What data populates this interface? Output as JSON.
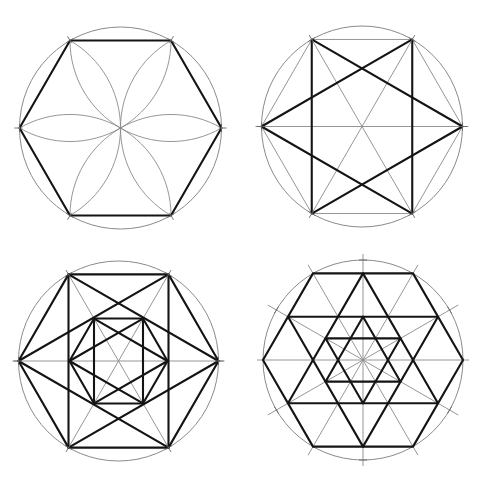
{
  "colors": {
    "background": "#ffffff",
    "bold_line": "#141414",
    "guide_line": "#8a8a8a"
  },
  "panels": [
    {
      "id": "hexagon-with-petals",
      "description": "Regular hexagon inscribed in a circle with six-petal rosette arcs (compass construction)",
      "center": [
        120.5,
        128
      ],
      "radius": 101,
      "elements": [
        "circle",
        "hexagon-bold",
        "petal-arcs",
        "vertex-ticks"
      ]
    },
    {
      "id": "hexagram-in-hexagon",
      "description": "Six-pointed star drawn between hexagon vertices, with rectangle sides and diagonal guides",
      "center": [
        362,
        126.5
      ],
      "radius": 100.5,
      "elements": [
        "circle",
        "hexagon-thin",
        "horizontal-diameter",
        "diagonals",
        "hexagram-bold",
        "vertex-ticks"
      ]
    },
    {
      "id": "nested-hexagram",
      "description": "Outer hexagon with hexagram, repeated at half scale inside",
      "center": [
        118.5,
        361
      ],
      "radius": 100,
      "inner_radius": 49,
      "elements": [
        "circle",
        "hexagon-bold",
        "hexagram-bold",
        "horizontal-diameter",
        "diagonals",
        "inner-hexagon-bold",
        "inner-hexagram-bold"
      ]
    },
    {
      "id": "triangular-lattice-star",
      "description": "Hexagon subdivided into triangular lattice with two nested stars of David and 12 radial guide lines",
      "center": [
        363,
        360
      ],
      "radius": 100,
      "elements": [
        "circle",
        "radial-guides-12",
        "hexagon-bold",
        "outer-star-bold",
        "inner-star-bold",
        "edge-ticks"
      ]
    }
  ]
}
